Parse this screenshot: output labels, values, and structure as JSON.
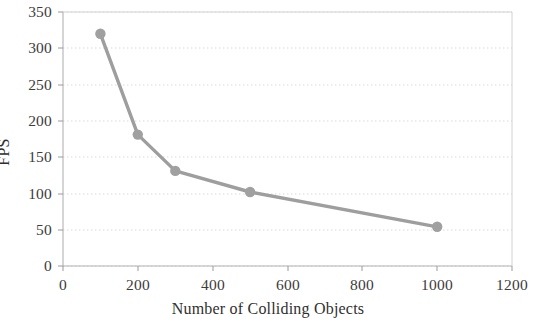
{
  "chart_data": {
    "type": "line",
    "title": "",
    "xlabel": "Number of Colliding Objects",
    "ylabel": "FPS",
    "x": [
      100,
      200,
      300,
      500,
      1000
    ],
    "values": [
      320,
      181,
      131,
      102,
      54
    ],
    "series": [
      {
        "name": "FPS",
        "x": [
          100,
          200,
          300,
          500,
          1000
        ],
        "values": [
          320,
          181,
          131,
          102,
          54
        ]
      }
    ],
    "xlim": [
      0,
      1200
    ],
    "ylim": [
      0,
      350
    ],
    "xticks": [
      0,
      200,
      400,
      600,
      800,
      1000,
      1200
    ],
    "yticks": [
      0,
      50,
      100,
      150,
      200,
      250,
      300,
      350
    ],
    "xtick_labels": [
      "0",
      "200",
      "400",
      "600",
      "800",
      "1000",
      "1200"
    ],
    "ytick_labels": [
      "0",
      "50",
      "100",
      "150",
      "200",
      "250",
      "300",
      "350"
    ],
    "grid": true,
    "grid_axis": "y",
    "grid_style": "dotted",
    "legend": "none",
    "marker": "circle",
    "line_color": "#9e9e9e",
    "marker_color": "#a0a0a0",
    "grid_color": "#d7d7d7",
    "axis_color": "#b5b5b5",
    "text_color": "#3c3c3c",
    "background_color": "#ffffff"
  },
  "geometry": {
    "plot_left": 63,
    "plot_right": 512,
    "plot_top": 12,
    "plot_bottom": 266
  }
}
